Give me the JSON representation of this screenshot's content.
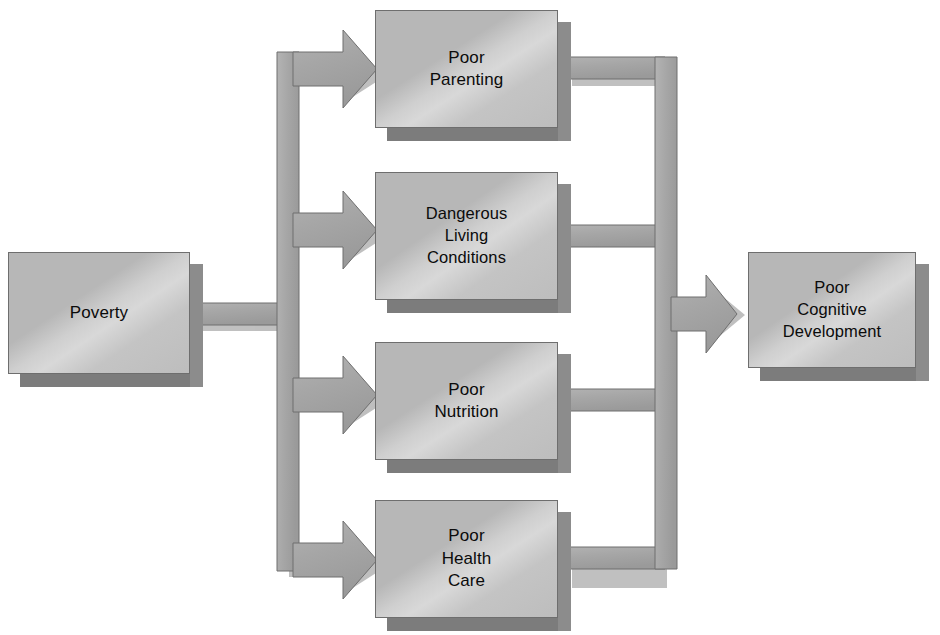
{
  "diagram": {
    "background_color": "#ffffff",
    "box_fill_light": "#d8d8d8",
    "box_fill_dark": "#b7b7b7",
    "box_border_color": "#6e6e6e",
    "box_shadow_color": "#7c7c7c",
    "arrow_fill_color": "#a8a8a8",
    "arrow_border_color": "#6e6e6e",
    "text_color": "#0b0b0b"
  },
  "source": {
    "id": "poverty",
    "label": "Poverty",
    "x": 8,
    "y": 252,
    "width": 182,
    "height": 122
  },
  "mediators": [
    {
      "id": "poor-parenting",
      "label": "Poor\nParenting",
      "x": 375,
      "y": 10,
      "width": 183,
      "height": 118
    },
    {
      "id": "dangerous-living-conditions",
      "label": "Dangerous\nLiving\nConditions",
      "x": 375,
      "y": 172,
      "width": 183,
      "height": 128
    },
    {
      "id": "poor-nutrition",
      "label": "Poor\nNutrition",
      "x": 375,
      "y": 342,
      "width": 183,
      "height": 118
    },
    {
      "id": "poor-health-care",
      "label": "Poor\nHealth\nCare",
      "x": 375,
      "y": 500,
      "width": 183,
      "height": 118
    }
  ],
  "outcome": {
    "id": "poor-cognitive-development",
    "label": "Poor\nCognitive\nDevelopment",
    "x": 748,
    "y": 252,
    "width": 168,
    "height": 116
  },
  "connectors": {
    "inbound_label": "Poverty leads to four mediating conditions",
    "outbound_label": "Four mediating conditions lead to poor cognitive development",
    "left_trunk_x": 277,
    "right_trunk_x": 655,
    "shaft_thickness": 22,
    "arrowhead_half_height": 22,
    "arrowhead_length": 26
  }
}
